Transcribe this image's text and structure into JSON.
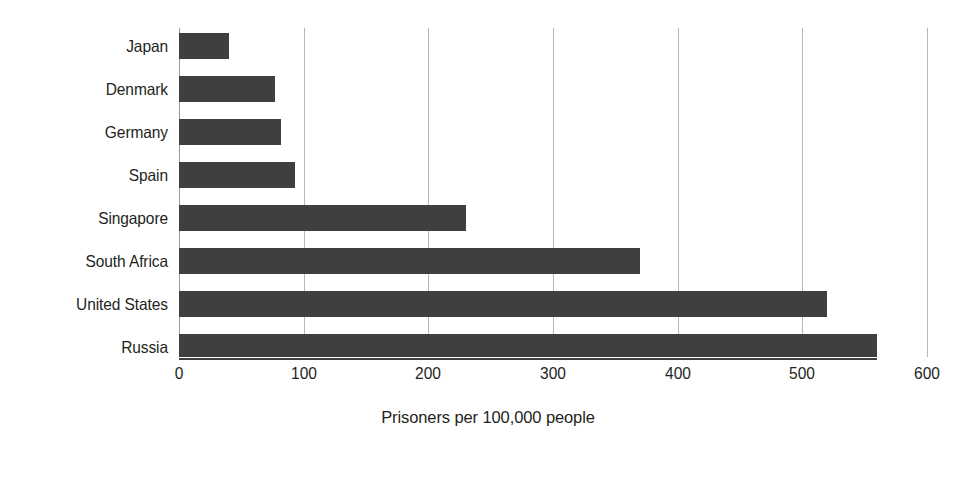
{
  "chart_data": {
    "type": "bar",
    "orientation": "horizontal",
    "title": "",
    "subtitle": "",
    "xlabel": "Prisoners per 100,000 people",
    "ylabel": "",
    "categories": [
      "Japan",
      "Denmark",
      "Germany",
      "Spain",
      "Singapore",
      "South Africa",
      "United States",
      "Russia"
    ],
    "values": [
      40,
      77,
      82,
      93,
      230,
      370,
      520,
      560
    ],
    "series": [
      {
        "name": "Prisoners per 100,000 people",
        "values": [
          40,
          77,
          82,
          93,
          230,
          370,
          520,
          560
        ]
      }
    ],
    "xlim": [
      0,
      600
    ],
    "xticks": [
      0,
      100,
      200,
      300,
      400,
      500,
      600
    ],
    "xtick_labels": [
      "0",
      "100",
      "200",
      "300",
      "400",
      "500",
      "600"
    ],
    "grid": "vertical",
    "legend": "none",
    "bar_color": "#3f3f3f",
    "gridline_color": "#b7b7b7",
    "background_color": "#ffffff",
    "text_color": "#231f20"
  },
  "figure": {
    "axis_title": "Prisoners per 100,000 people"
  }
}
